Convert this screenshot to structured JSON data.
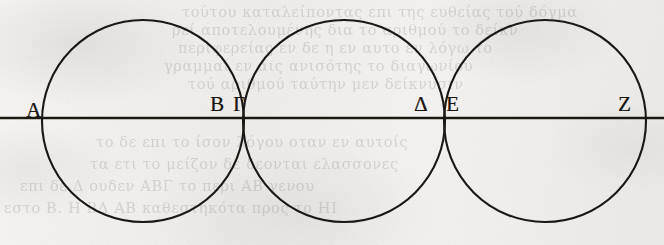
{
  "page": {
    "kind": "scanned-manuscript-figure",
    "width": 664,
    "height": 245,
    "background_color": "#f2f1ef",
    "ink_color": "#17150f"
  },
  "figure": {
    "caption": "Three mutually tangent equal circles on a common diameter line",
    "baseline": {
      "name": "diameter-line",
      "y": 118,
      "x_start": 0,
      "x_end": 664
    },
    "circles": [
      {
        "id": "circle-1",
        "cx": 143,
        "cy": 121,
        "r": 101
      },
      {
        "id": "circle-2",
        "cx": 344,
        "cy": 121,
        "r": 101
      },
      {
        "id": "circle-3",
        "cx": 545,
        "cy": 121,
        "r": 101
      }
    ],
    "labels": [
      {
        "id": "label-A",
        "text": "A",
        "x": 26,
        "y": 100
      },
      {
        "id": "label-B",
        "text": "B",
        "x": 210,
        "y": 94
      },
      {
        "id": "label-G",
        "text": "Γ",
        "x": 233,
        "y": 94
      },
      {
        "id": "label-D",
        "text": "Δ",
        "x": 414,
        "y": 94
      },
      {
        "id": "label-E",
        "text": "E",
        "x": 446,
        "y": 94
      },
      {
        "id": "label-Z",
        "text": "Z",
        "x": 618,
        "y": 94
      }
    ]
  },
  "bleed_through_text": {
    "note": "faint show-through of Greek text from the reverse side of the leaf",
    "lines": [
      {
        "text": "τούτου καταλείποντας επι της ευθείας τού δόγμα",
        "x": 182,
        "y": 4,
        "size": 14,
        "mirror": false
      },
      {
        "text": "ρεί αποτελουμένης δια το αριθμού το δείκν",
        "x": 172,
        "y": 22,
        "size": 14,
        "mirror": false
      },
      {
        "text": "περιφερείας εν δε η εν αυτο εν λόγω το",
        "x": 178,
        "y": 40,
        "size": 14,
        "mirror": false
      },
      {
        "text": "γραμμαί εν αις ανισότης το διαγωνίου",
        "x": 164,
        "y": 58,
        "size": 14,
        "mirror": false
      },
      {
        "text": "τού αριθμού ταύτην μεν δείκνυσιν",
        "x": 188,
        "y": 76,
        "size": 14,
        "mirror": false
      },
      {
        "text": "το δε επι το ίσον λόγου οταν εν αυτοίς",
        "x": 96,
        "y": 134,
        "size": 14,
        "mirror": false
      },
      {
        "text": "τα ετι το μείζον δε δεονται ελασσονες",
        "x": 90,
        "y": 156,
        "size": 14,
        "mirror": false
      },
      {
        "text": "επι δε Δ ουδεν ΑΒΓ το περι ΑΒ γενου",
        "x": 20,
        "y": 178,
        "size": 14,
        "mirror": false
      },
      {
        "text": "εστο Β. Η ΒΔ ΑΒ καθεστηκότα προς το ΗΙ",
        "x": 4,
        "y": 200,
        "size": 14,
        "mirror": false
      }
    ]
  }
}
